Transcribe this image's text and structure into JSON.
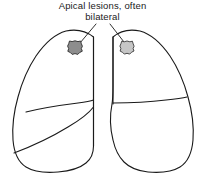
{
  "figure": {
    "title_line_1": "Apical lesions, often",
    "title_line_2": "bilateral",
    "background_color": "#ffffff",
    "outline_color": "#1a1a1a"
  },
  "annotation": {
    "leader_line_left_label": "leader line to left apical lesion",
    "leader_line_right_label": "leader line to right apical lesion"
  },
  "anatomy": {
    "left_lung": {
      "label": "left lung outline",
      "lobes": 3,
      "fissure_upper_label": "upper oblique fissure",
      "fissure_lower_label": "lower oblique fissure"
    },
    "right_lung": {
      "label": "right lung outline",
      "lobes": 2,
      "fissure_label": "horizontal fissure"
    }
  },
  "lesions": [
    {
      "name": "left-apical-lesion",
      "fill_color": "#8d8d8d",
      "stroke_color": "#2b2b2b",
      "cx": 75,
      "cy": 48,
      "r": 7.2
    },
    {
      "name": "right-apical-lesion",
      "fill_color": "#c6c6c6",
      "stroke_color": "#3a3a3a",
      "cx": 127,
      "cy": 48,
      "r": 7.0
    }
  ]
}
